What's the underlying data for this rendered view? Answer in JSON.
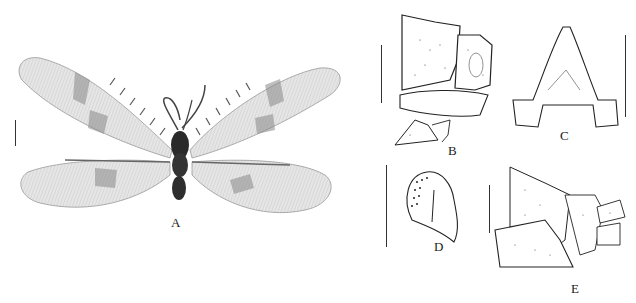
{
  "figure": {
    "panels": [
      {
        "id": "A",
        "label": "A",
        "description": "Habitus, dorsal view, wings spread"
      },
      {
        "id": "B",
        "label": "B",
        "description": "Male terminalia, lateral view"
      },
      {
        "id": "C",
        "label": "C",
        "description": "Structure, dorsal view"
      },
      {
        "id": "D",
        "label": "D",
        "description": "Ectoproct / callus cerci detail"
      },
      {
        "id": "E",
        "label": "E",
        "description": "Female terminalia, lateral view"
      }
    ],
    "colors": {
      "background": "#ffffff",
      "ink": "#222222",
      "wing_fill": "#e4e4e4",
      "wing_pattern": "#8a8a8a",
      "body": "#2a2a2a"
    }
  }
}
